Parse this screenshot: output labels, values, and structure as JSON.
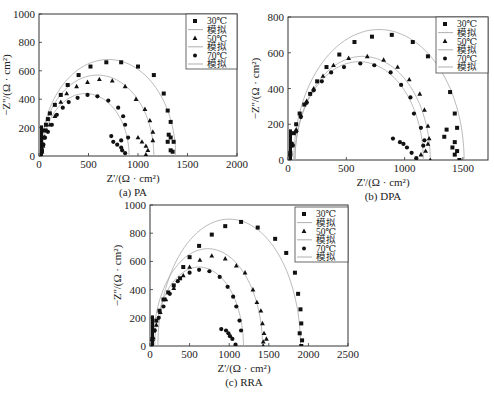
{
  "chart_data": [
    {
      "id": "a",
      "type": "scatter",
      "caption": "(a) PA",
      "xlabel": "Z'/(Ω · cm²)",
      "ylabel": "−Z''/(Ω · cm²)",
      "xlim": [
        0,
        2000
      ],
      "ylim": [
        0,
        1000
      ],
      "xticks": [
        0,
        500,
        1000,
        1500,
        2000
      ],
      "yticks": [
        0,
        200,
        400,
        600,
        800,
        1000
      ],
      "legend": [
        "30℃",
        "模拟",
        "50℃",
        "模拟",
        "70℃",
        "模拟"
      ],
      "layout": {
        "x0": 39,
        "x1": 237,
        "y0": 156,
        "y1": 14,
        "legend": [
          186,
          14,
          51,
          55
        ]
      },
      "series": [
        {
          "name": "30℃",
          "marker": "square",
          "fit_center": [
            700,
            0
          ],
          "fit_r": 680,
          "points": [
            [
              30,
              40
            ],
            [
              35,
              80
            ],
            [
              45,
              130
            ],
            [
              55,
              180
            ],
            [
              70,
              220
            ],
            [
              90,
              260
            ],
            [
              110,
              300
            ],
            [
              160,
              360
            ],
            [
              220,
              430
            ],
            [
              290,
              500
            ],
            [
              400,
              570
            ],
            [
              520,
              630
            ],
            [
              680,
              660
            ],
            [
              830,
              660
            ],
            [
              1000,
              630
            ],
            [
              1160,
              570
            ],
            [
              1260,
              440
            ],
            [
              1300,
              320
            ],
            [
              1330,
              240
            ],
            [
              1310,
              150
            ],
            [
              1330,
              130
            ],
            [
              1300,
              100
            ],
            [
              1360,
              100
            ],
            [
              1330,
              40
            ],
            [
              1350,
              30
            ]
          ]
        },
        {
          "name": "50℃",
          "marker": "triangle",
          "fit_center": [
            590,
            0
          ],
          "fit_r": 570,
          "points": [
            [
              30,
              30
            ],
            [
              40,
              70
            ],
            [
              55,
              130
            ],
            [
              80,
              180
            ],
            [
              110,
              220
            ],
            [
              160,
              280
            ],
            [
              220,
              380
            ],
            [
              280,
              440
            ],
            [
              380,
              490
            ],
            [
              490,
              520
            ],
            [
              610,
              540
            ],
            [
              740,
              530
            ],
            [
              870,
              490
            ],
            [
              980,
              400
            ],
            [
              1070,
              330
            ],
            [
              1120,
              250
            ],
            [
              1150,
              170
            ],
            [
              1150,
              110
            ],
            [
              1000,
              130
            ],
            [
              1040,
              100
            ],
            [
              1080,
              70
            ],
            [
              1100,
              40
            ],
            [
              1080,
              10
            ]
          ]
        },
        {
          "name": "70℃",
          "marker": "circle",
          "fit_center": [
            470,
            0
          ],
          "fit_r": 440,
          "points": [
            [
              30,
              30
            ],
            [
              45,
              80
            ],
            [
              60,
              130
            ],
            [
              90,
              170
            ],
            [
              130,
              220
            ],
            [
              180,
              290
            ],
            [
              240,
              340
            ],
            [
              300,
              380
            ],
            [
              390,
              410
            ],
            [
              490,
              430
            ],
            [
              590,
              420
            ],
            [
              700,
              390
            ],
            [
              800,
              340
            ],
            [
              850,
              280
            ],
            [
              870,
              220
            ],
            [
              900,
              130
            ],
            [
              730,
              140
            ],
            [
              750,
              100
            ],
            [
              790,
              80
            ],
            [
              830,
              60
            ],
            [
              840,
              40
            ],
            [
              870,
              20
            ],
            [
              830,
              110
            ]
          ]
        }
      ]
    },
    {
      "id": "b",
      "type": "scatter",
      "caption": "(b) DPA",
      "xlabel": "Z'/(Ω · cm²)",
      "ylabel": "−Z''/(Ω · cm²)",
      "xlim": [
        0,
        1715
      ],
      "ylim": [
        0,
        800
      ],
      "xticks": [
        0,
        500,
        1000,
        1500
      ],
      "yticks": [
        0,
        200,
        400,
        600,
        800
      ],
      "legend": [
        "30℃",
        "模拟",
        "50℃",
        "模拟",
        "70℃",
        "模拟"
      ],
      "layout": {
        "x0": 288,
        "x1": 488,
        "y0": 160,
        "y1": 17,
        "legend": [
          436,
          17,
          52,
          56
        ]
      },
      "series": [
        {
          "name": "30℃",
          "marker": "square",
          "fit_center": [
            780,
            0
          ],
          "fit_r": 730,
          "points": [
            [
              20,
              40
            ],
            [
              30,
              90
            ],
            [
              50,
              150
            ],
            [
              70,
              200
            ],
            [
              100,
              260
            ],
            [
              140,
              310
            ],
            [
              190,
              370
            ],
            [
              250,
              440
            ],
            [
              330,
              520
            ],
            [
              440,
              590
            ],
            [
              570,
              660
            ],
            [
              720,
              690
            ],
            [
              890,
              700
            ],
            [
              1070,
              660
            ],
            [
              1200,
              580
            ],
            [
              1390,
              380
            ],
            [
              1430,
              260
            ],
            [
              1450,
              180
            ],
            [
              1360,
              170
            ],
            [
              1340,
              130
            ],
            [
              1430,
              100
            ],
            [
              1410,
              70
            ],
            [
              1450,
              50
            ],
            [
              1430,
              30
            ],
            [
              1470,
              0
            ]
          ]
        },
        {
          "name": "50℃",
          "marker": "triangle",
          "fit_center": [
            640,
            0
          ],
          "fit_r": 580,
          "points": [
            [
              20,
              30
            ],
            [
              40,
              90
            ],
            [
              70,
              170
            ],
            [
              110,
              250
            ],
            [
              160,
              330
            ],
            [
              220,
              400
            ],
            [
              300,
              470
            ],
            [
              390,
              530
            ],
            [
              520,
              570
            ],
            [
              680,
              580
            ],
            [
              820,
              560
            ],
            [
              940,
              520
            ],
            [
              1040,
              450
            ],
            [
              1130,
              370
            ],
            [
              1170,
              280
            ],
            [
              1200,
              190
            ],
            [
              1210,
              120
            ],
            [
              1200,
              90
            ],
            [
              1180,
              50
            ],
            [
              1140,
              30
            ],
            [
              1220,
              0
            ]
          ]
        },
        {
          "name": "70℃",
          "marker": "circle",
          "fit_center": [
            610,
            0
          ],
          "fit_r": 550,
          "points": [
            [
              20,
              30
            ],
            [
              40,
              80
            ],
            [
              70,
              160
            ],
            [
              110,
              240
            ],
            [
              160,
              320
            ],
            [
              220,
              390
            ],
            [
              290,
              440
            ],
            [
              370,
              490
            ],
            [
              480,
              520
            ],
            [
              620,
              540
            ],
            [
              740,
              530
            ],
            [
              880,
              490
            ],
            [
              970,
              420
            ],
            [
              1050,
              350
            ],
            [
              1080,
              260
            ],
            [
              1140,
              180
            ],
            [
              1170,
              110
            ],
            [
              1160,
              80
            ],
            [
              900,
              120
            ],
            [
              960,
              100
            ],
            [
              990,
              90
            ],
            [
              1020,
              70
            ],
            [
              1060,
              40
            ],
            [
              1100,
              10
            ]
          ]
        }
      ]
    },
    {
      "id": "c",
      "type": "scatter",
      "caption": "(c) RRA",
      "xlabel": "Z'/(Ω · cm²)",
      "ylabel": "−Z''/(Ω · cm²)",
      "xlim": [
        0,
        2500
      ],
      "ylim": [
        0,
        1000
      ],
      "xticks": [
        0,
        500,
        1000,
        1500,
        2000,
        2500
      ],
      "yticks": [
        0,
        200,
        400,
        600,
        800,
        1000
      ],
      "legend": [
        "30℃",
        "模拟",
        "50℃",
        "模拟",
        "70℃",
        "模拟"
      ],
      "layout": {
        "x0": 150,
        "x1": 348,
        "y0": 346,
        "y1": 205,
        "legend": [
          295,
          207,
          53,
          55
        ]
      },
      "series": [
        {
          "name": "30℃",
          "marker": "square",
          "fit_center": [
            1000,
            0
          ],
          "fit_r": 900,
          "points": [
            [
              30,
              50
            ],
            [
              50,
              110
            ],
            [
              80,
              180
            ],
            [
              120,
              250
            ],
            [
              170,
              330
            ],
            [
              230,
              380
            ],
            [
              300,
              430
            ],
            [
              380,
              480
            ],
            [
              420,
              560
            ],
            [
              500,
              630
            ],
            [
              620,
              710
            ],
            [
              780,
              790
            ],
            [
              950,
              850
            ],
            [
              1150,
              880
            ],
            [
              1360,
              840
            ],
            [
              1580,
              760
            ],
            [
              1720,
              660
            ],
            [
              1830,
              520
            ],
            [
              1870,
              370
            ],
            [
              1900,
              260
            ],
            [
              1910,
              160
            ],
            [
              1890,
              90
            ],
            [
              1920,
              40
            ],
            [
              1910,
              0
            ]
          ]
        },
        {
          "name": "50℃",
          "marker": "triangle",
          "fit_center": [
            730,
            0
          ],
          "fit_r": 690,
          "points": [
            [
              40,
              60
            ],
            [
              80,
              150
            ],
            [
              130,
              240
            ],
            [
              200,
              330
            ],
            [
              300,
              410
            ],
            [
              420,
              500
            ],
            [
              500,
              560
            ],
            [
              630,
              610
            ],
            [
              780,
              640
            ],
            [
              950,
              620
            ],
            [
              1090,
              570
            ],
            [
              1200,
              520
            ],
            [
              1300,
              400
            ],
            [
              1350,
              310
            ],
            [
              1400,
              250
            ],
            [
              1420,
              160
            ],
            [
              1440,
              90
            ],
            [
              1470,
              50
            ],
            [
              1430,
              30
            ],
            [
              1430,
              0
            ]
          ]
        },
        {
          "name": "70℃",
          "marker": "circle",
          "fit_center": [
            620,
            0
          ],
          "fit_r": 560,
          "points": [
            [
              30,
              40
            ],
            [
              60,
              110
            ],
            [
              110,
              200
            ],
            [
              170,
              280
            ],
            [
              250,
              370
            ],
            [
              350,
              460
            ],
            [
              500,
              520
            ],
            [
              620,
              540
            ],
            [
              750,
              530
            ],
            [
              880,
              490
            ],
            [
              980,
              420
            ],
            [
              1050,
              350
            ],
            [
              1090,
              280
            ],
            [
              1130,
              180
            ],
            [
              1150,
              110
            ],
            [
              900,
              120
            ],
            [
              960,
              110
            ],
            [
              990,
              90
            ],
            [
              1010,
              70
            ],
            [
              1040,
              50
            ],
            [
              1080,
              10
            ]
          ]
        }
      ]
    }
  ]
}
